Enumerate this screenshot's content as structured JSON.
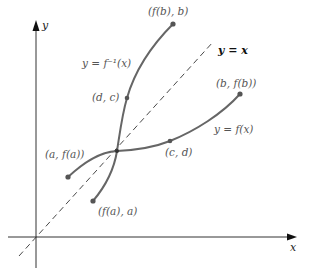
{
  "diagram": {
    "title": "",
    "axes": {
      "x_label": "x",
      "y_label": "y"
    },
    "lines": {
      "identity_label": "y = x"
    },
    "curves": {
      "f_label": "y = f(x)",
      "f_inverse_label": "y = f⁻¹(x)"
    },
    "points": {
      "a_fa": "(a, f(a))",
      "fa_a": "(f(a), a)",
      "c_d": "(c, d)",
      "d_c": "(d, c)",
      "b_fb": "(b, f(b))",
      "fb_b": "(f(b), b)"
    },
    "colors": {
      "curve": "#666666",
      "axis": "#333333",
      "dashed": "#333333",
      "label": "#555555"
    }
  }
}
